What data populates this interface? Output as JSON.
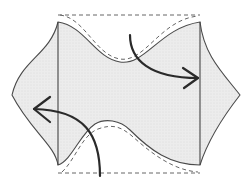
{
  "diagram": {
    "type": "fold-instruction",
    "colors": {
      "fabric_fill": "#e9e9e9",
      "outline": "#4a4a4a",
      "arrow": "#2a2a2a",
      "dashed": "#666666"
    },
    "arrows": [
      {
        "name": "fold-right-arrow",
        "direction": "down-right",
        "from": [
          130,
          35
        ],
        "to": [
          200,
          78
        ]
      },
      {
        "name": "fold-left-arrow",
        "direction": "up-left",
        "from": [
          100,
          176
        ],
        "to": [
          33,
          107
        ]
      }
    ],
    "fold_lines": [
      {
        "name": "left-fold-line",
        "x": 58
      },
      {
        "name": "right-fold-line",
        "x": 200
      }
    ]
  }
}
